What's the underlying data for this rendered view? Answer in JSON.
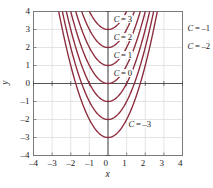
{
  "chart_data": {
    "type": "line",
    "title": "",
    "subtitle": "",
    "xlabel": "x",
    "ylabel": "y",
    "xlim": [
      -4,
      4
    ],
    "ylim": [
      -4,
      4
    ],
    "grid": true,
    "legend_position": "inline-curve-labels",
    "curve_color": "#8B2B3B",
    "axis_color": "#555555",
    "grid_color": "#d8d8d8",
    "frame_color": "#7a7a7a",
    "equation_family": "y = x^2 + C",
    "xticks": [
      "-4",
      "-3",
      "-2",
      "-1",
      "0",
      "1",
      "2",
      "3",
      "4"
    ],
    "xtick_values": [
      -4,
      -3,
      -2,
      -1,
      0,
      1,
      2,
      3,
      4
    ],
    "yticks": [
      "-4",
      "-3",
      "-2",
      "-1",
      "0",
      "1",
      "2",
      "3",
      "4"
    ],
    "ytick_values": [
      -4,
      -3,
      -2,
      -1,
      0,
      1,
      2,
      3,
      4
    ],
    "series": [
      {
        "name": "C = 3",
        "C": 3,
        "a": 1,
        "vertex": [
          0,
          3
        ],
        "label": "C = 3"
      },
      {
        "name": "C = 2",
        "C": 2,
        "a": 1,
        "vertex": [
          0,
          2
        ],
        "label": "C = 2"
      },
      {
        "name": "C = 1",
        "C": 1,
        "a": 1,
        "vertex": [
          0,
          1
        ],
        "label": "C = 1"
      },
      {
        "name": "C = 0",
        "C": 0,
        "a": 1,
        "vertex": [
          0,
          0
        ],
        "label": "C = 0"
      },
      {
        "name": "C = -1",
        "C": -1,
        "a": 1,
        "vertex": [
          0,
          -1
        ],
        "label": "C = –1"
      },
      {
        "name": "C = -2",
        "C": -2,
        "a": 1,
        "vertex": [
          0,
          -2
        ],
        "label": "C = –2"
      },
      {
        "name": "C = -3",
        "C": -3,
        "a": 1,
        "vertex": [
          0,
          -3
        ],
        "label": "C = –3"
      }
    ],
    "annotations": [
      {
        "text": "C = 3",
        "x": 0.25,
        "y": 3.55,
        "anchor": "left",
        "place": "inside"
      },
      {
        "text": "C = 2",
        "x": 0.25,
        "y": 2.55,
        "anchor": "left",
        "place": "inside"
      },
      {
        "text": "C = 1",
        "x": 0.25,
        "y": 1.55,
        "anchor": "left",
        "place": "inside"
      },
      {
        "text": "C = 0",
        "x": 0.25,
        "y": 0.55,
        "anchor": "left",
        "place": "inside"
      },
      {
        "text": "C = –1",
        "x": 4.45,
        "y": 3.05,
        "anchor": "left",
        "place": "outside-right"
      },
      {
        "text": "C = –2",
        "x": 4.45,
        "y": 2.05,
        "anchor": "left",
        "place": "outside-right"
      },
      {
        "text": "C = –3",
        "x": 1.05,
        "y": -2.3,
        "anchor": "left",
        "place": "inside"
      }
    ]
  },
  "axes": {
    "x_label": "x",
    "y_label": "y"
  }
}
